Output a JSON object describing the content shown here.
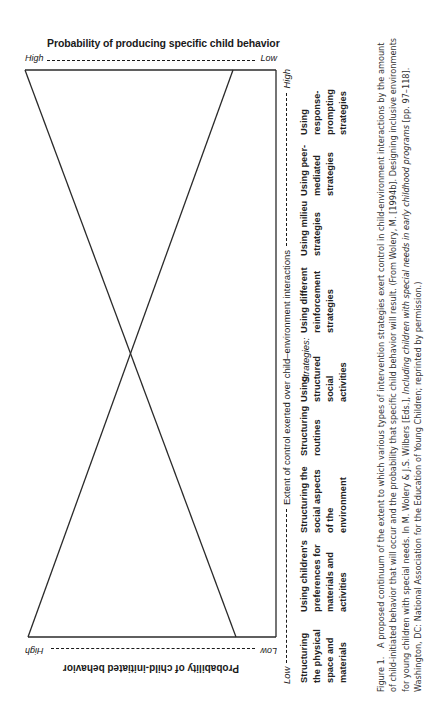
{
  "figure": {
    "top_axis": {
      "title": "Probability of producing specific child behavior",
      "left_label": "High",
      "right_label": "Low"
    },
    "bottom_axis": {
      "title": "Probability of child-initiated behavior",
      "left_label": "Low",
      "right_label": "High"
    },
    "right_axis": {
      "title": "Extent of control exerted over child–environment interactions",
      "low_label": "Low",
      "high_label": "High"
    },
    "strategies_label": "Strategies:",
    "strategies": [
      {
        "lines": [
          "Structuring",
          "the physical",
          "space and",
          "materials"
        ]
      },
      {
        "lines": [
          "Using children's",
          "preferences for",
          "materials and",
          "activities"
        ]
      },
      {
        "lines": [
          "Structuring the",
          "social aspects",
          "of the",
          "environment"
        ]
      },
      {
        "lines": [
          "Structuring",
          "routines"
        ]
      },
      {
        "lines": [
          "Using",
          "structured",
          "social",
          "activities"
        ]
      },
      {
        "lines": [
          "Using different",
          "reinforcement",
          "strategies"
        ]
      },
      {
        "lines": [
          "Using milieu",
          "strategies"
        ]
      },
      {
        "lines": [
          "Using peer-",
          "mediated",
          "strategies"
        ]
      },
      {
        "lines": [
          "Using",
          "response-",
          "prompting",
          "strategies"
        ]
      }
    ],
    "caption": {
      "label": "Figure 1.",
      "text_before_italic": "A proposed continuum of the extent to which various types of intervention strategies exert control in child-environment interactions by the amount of child-initiated behavior that will occur and the probability that specific child behavior will result. (From Wolery, M. [1994b]. Designing inclusive environments for young children with special needs. In M. Wolery & J.S. Wilbers [Eds.],",
      "italic": "Including children with special needs in early childhood programs",
      "text_after_italic": "[pp. 97–118]. Washington, DC: National Association for the Education of Young Children; reprinted by permission.)"
    }
  }
}
